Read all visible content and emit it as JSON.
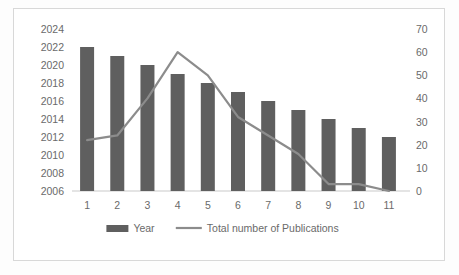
{
  "chart_data": {
    "type": "bar",
    "title": "",
    "subtitle": "",
    "xlabel": "",
    "ylabel": "",
    "grid": false,
    "legend_position": "bottom",
    "categories": [
      "1",
      "2",
      "3",
      "4",
      "5",
      "6",
      "7",
      "8",
      "9",
      "10",
      "11"
    ],
    "series": [
      {
        "name": "Year",
        "type": "bar",
        "axis": "left",
        "color": "#5f5f5f",
        "values": [
          2022,
          2021,
          2020,
          2019,
          2018,
          2017,
          2016,
          2015,
          2014,
          2013,
          2012
        ]
      },
      {
        "name": "Total number of Publications",
        "type": "line",
        "axis": "right",
        "color": "#8c8c8c",
        "values": [
          22,
          24,
          40,
          60,
          50,
          32,
          24,
          16,
          3,
          3,
          0
        ]
      }
    ],
    "left_axis": {
      "label": "",
      "min": 2006,
      "max": 2024,
      "step": 2,
      "ticks": [
        "2024",
        "2022",
        "2020",
        "2018",
        "2016",
        "2014",
        "2012",
        "2010",
        "2008",
        "2006"
      ]
    },
    "right_axis": {
      "label": "",
      "min": 0,
      "max": 70,
      "step": 10,
      "ticks": [
        "70",
        "60",
        "50",
        "40",
        "30",
        "20",
        "10",
        "0"
      ]
    },
    "x_axis": {
      "label": "",
      "ticks": [
        "1",
        "2",
        "3",
        "4",
        "5",
        "6",
        "7",
        "8",
        "9",
        "10",
        "11"
      ]
    },
    "legend": [
      {
        "label": "Year",
        "marker": "bar",
        "color": "#5f5f5f"
      },
      {
        "label": "Total number of Publications",
        "marker": "line",
        "color": "#8c8c8c"
      }
    ]
  }
}
